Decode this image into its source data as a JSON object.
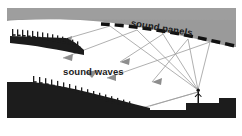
{
  "figure": {
    "kind": "acoustic-section-diagram",
    "width": 242,
    "height": 136,
    "background": "#ffffff"
  },
  "labels": {
    "sound_panels": "sound panels",
    "sound_waves": "sound waves"
  },
  "colors": {
    "ceiling_gray": "#9a9a9a",
    "structure_dark": "#1c1c1c",
    "panel_black": "#111111",
    "ray_gray": "#9c9c9c",
    "arrow_gray": "#8d8d8d",
    "paper_white": "#ffffff",
    "text": "#1b1b1b"
  },
  "elements": {
    "ceiling": {
      "name": "ceiling-mass",
      "note": "gray band across top with concave lower edge"
    },
    "sound_panels": {
      "name": "reflector-panel-array",
      "segments": 11,
      "note": "dashed black arc suspended below ceiling"
    },
    "balcony": {
      "name": "upper-balcony-seating",
      "seat_count": 14
    },
    "orchestra": {
      "name": "main-floor-seating",
      "seat_count": 17
    },
    "stage": {
      "name": "stage-platform"
    },
    "pit": {
      "name": "orchestra-pit-step"
    },
    "performer": {
      "name": "performer-figure",
      "note": "standing silhouette on stage, sound source"
    }
  },
  "rays": {
    "name": "sound-ray-paths",
    "source": "performer",
    "count": 10,
    "note": "straight gray rays from performer up to panels, reflecting down to balcony and orchestra seating",
    "arrowheads": 6
  }
}
